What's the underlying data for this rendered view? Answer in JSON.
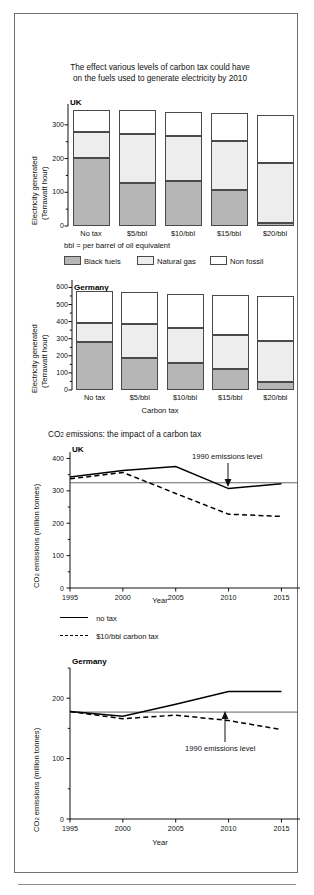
{
  "figure": {
    "bar_title_line1": "The effect various levels of carbon tax could have",
    "bar_title_line2": "on the fuels used to generate electricity by 2010",
    "bbl_note": "bbl = per barrel of oil equivalent",
    "line_title": "CO2 emissions: the impact of a carbon tax"
  },
  "legend_fuels": [
    {
      "label": "Black fuels",
      "color": "#b6b6b6"
    },
    {
      "label": "Natural gas",
      "color": "#ededed"
    },
    {
      "label": "Non fossil",
      "color": "#ffffff"
    }
  ],
  "legend_lines": [
    {
      "label": "no tax",
      "style": "solid"
    },
    {
      "label": "$10/bbl carbon tax",
      "style": "dashed"
    }
  ],
  "annotations": {
    "uk_1990": "1990 emissions level",
    "germany_1990": "1990 emissions level"
  },
  "panels": {
    "uk_bar": "UK",
    "germany_bar": "Germany",
    "uk_line": "UK",
    "germany_line": "Germany"
  },
  "axis_labels": {
    "electricity_y1": "Electricity generated",
    "electricity_y2": "(Terrawatt hour)",
    "carbon_tax_x": "Carbon tax",
    "co2_y1": "CO2 emissions (million tonnes)",
    "year_x": "Year"
  },
  "chart_data": [
    {
      "type": "bar",
      "id": "uk-fuel-mix",
      "title": "The effect various levels of carbon tax could have on the fuels used to generate electricity by 2010",
      "panel": "UK",
      "stacked": true,
      "xlabel": "Carbon tax",
      "ylabel": "Electricity generated (Terrawatt hour)",
      "ylim": [
        0,
        350
      ],
      "yticks": [
        0,
        100,
        200,
        300
      ],
      "ytick_minor": [
        50,
        150,
        250
      ],
      "grid": false,
      "categories": [
        "No tax",
        "$5/bbl",
        "$10/bbl",
        "$15/bbl",
        "$20/bbl"
      ],
      "series": [
        {
          "name": "Black fuels",
          "color": "#b6b6b6",
          "values": [
            201,
            129,
            132,
            107,
            9
          ]
        },
        {
          "name": "Natural gas",
          "color": "#ededed",
          "values": [
            78,
            144,
            135,
            144,
            178
          ]
        },
        {
          "name": "Non fossil",
          "color": "#ffffff",
          "values": [
            66,
            70,
            71,
            83,
            142
          ]
        }
      ],
      "totals": [
        345,
        343,
        338,
        334,
        329
      ]
    },
    {
      "type": "bar",
      "id": "germany-fuel-mix",
      "panel": "Germany",
      "stacked": true,
      "xlabel": "Carbon tax",
      "ylabel": "Electricity generated (Terrawatt hour)",
      "ylim": [
        0,
        620
      ],
      "yticks": [
        0,
        100,
        200,
        300,
        400,
        500,
        600
      ],
      "grid": false,
      "categories": [
        "No tax",
        "$5/bbl",
        "$10/bbl",
        "$15/bbl",
        "$20/bbl"
      ],
      "series": [
        {
          "name": "Black fuels",
          "color": "#b6b6b6",
          "values": [
            279,
            185,
            156,
            120,
            46
          ]
        },
        {
          "name": "Natural gas",
          "color": "#ededed",
          "values": [
            114,
            203,
            205,
            201,
            240
          ]
        },
        {
          "name": "Non fossil",
          "color": "#ffffff",
          "values": [
            186,
            184,
            203,
            236,
            266
          ]
        }
      ],
      "totals": [
        579,
        572,
        564,
        557,
        552
      ]
    },
    {
      "type": "line",
      "id": "uk-co2",
      "title": "CO2 emissions: the impact of a carbon tax",
      "panel": "UK",
      "xlabel": "Year",
      "ylabel": "CO2 emissions (million tonnes)",
      "x": [
        1995,
        2000,
        2005,
        2010,
        2015
      ],
      "xlim": [
        1995,
        2016
      ],
      "ylim": [
        0,
        420
      ],
      "yticks": [
        0,
        100,
        200,
        300,
        400
      ],
      "ytick_minor": [
        50,
        150,
        250,
        350
      ],
      "grid": false,
      "legend_position": "below",
      "series": [
        {
          "name": "no tax",
          "style": "solid",
          "values": [
            343,
            363,
            375,
            307,
            322
          ]
        },
        {
          "name": "$10/bbl carbon tax",
          "style": "dashed",
          "values": [
            337,
            357,
            292,
            228,
            221
          ]
        }
      ],
      "reference_line": {
        "label": "1990 emissions level",
        "value": 325
      }
    },
    {
      "type": "line",
      "id": "germany-co2",
      "panel": "Germany",
      "xlabel": "Year",
      "ylabel": "CO2 emissions (million tonnes)",
      "x": [
        1995,
        2000,
        2005,
        2010,
        2015
      ],
      "xlim": [
        1995,
        2016
      ],
      "ylim": [
        0,
        250
      ],
      "yticks": [
        0,
        100,
        200
      ],
      "ytick_minor": [
        50,
        150,
        250
      ],
      "grid": false,
      "series": [
        {
          "name": "no tax",
          "style": "solid",
          "values": [
            178,
            170,
            190,
            211,
            211
          ]
        },
        {
          "name": "$10/bbl carbon tax",
          "style": "dashed",
          "values": [
            178,
            166,
            172,
            163,
            148
          ]
        }
      ],
      "reference_line": {
        "label": "1990 emissions level",
        "value": 177
      }
    }
  ]
}
